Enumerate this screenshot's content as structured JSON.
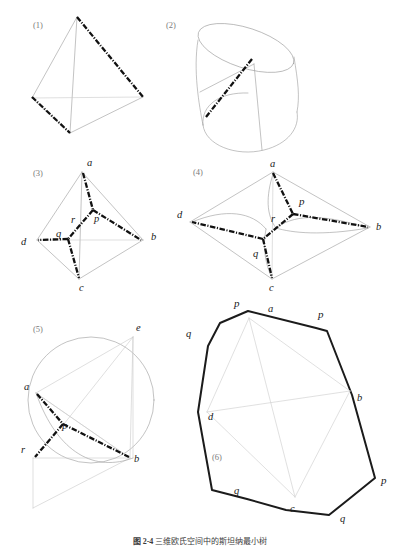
{
  "figure": {
    "background_color": "#ffffff",
    "ink_color": "#111111",
    "thin_line_color": "#9a9a9a",
    "pale_line_color": "#d2d2d2",
    "panel_number_color": "#7a7a7a"
  },
  "panels": [
    {
      "id": "panel-1",
      "number": "(1)",
      "description": "tetrahedron wireframe with two bold dash-dot edges",
      "labels": []
    },
    {
      "id": "panel-2",
      "number": "(2)",
      "description": "tilted cylinder with a bold dash-dot generatrix line",
      "labels": []
    },
    {
      "id": "panel-3",
      "number": "(3)",
      "description": "tetrahedron with Steiner tree a-p-b, p-r-q, q-d, q-c",
      "labels": [
        "a",
        "b",
        "c",
        "d",
        "p",
        "q",
        "r"
      ]
    },
    {
      "id": "panel-4",
      "number": "(4)",
      "description": "unfolded tetrahedron rhombus with curved creases and Steiner tree",
      "labels": [
        "a",
        "b",
        "c",
        "d",
        "p",
        "q",
        "r"
      ]
    },
    {
      "id": "panel-5",
      "number": "(5)",
      "description": "circle with inscribed triangle a-b-e and Steiner point p, r",
      "labels": [
        "a",
        "b",
        "e",
        "p",
        "r"
      ]
    },
    {
      "id": "panel-6",
      "number": "(6)",
      "description": "heavy octagonal outline with inner quadrilateral a-b-c-d",
      "labels": [
        "a",
        "b",
        "c",
        "d",
        "p",
        "p",
        "p",
        "q",
        "q",
        "q"
      ]
    }
  ],
  "vertex_labels": {
    "panel3": [
      {
        "text": "a",
        "x": 87,
        "y": 166
      },
      {
        "text": "b",
        "x": 151,
        "y": 240
      },
      {
        "text": "c",
        "x": 79,
        "y": 286
      },
      {
        "text": "d",
        "x": 25,
        "y": 242
      },
      {
        "text": "p",
        "x": 94,
        "y": 218
      },
      {
        "text": "q",
        "x": 58,
        "y": 237
      },
      {
        "text": "r",
        "x": 72,
        "y": 222
      }
    ],
    "panel4": [
      {
        "text": "a",
        "x": 275,
        "y": 166
      },
      {
        "text": "b",
        "x": 378,
        "y": 227
      },
      {
        "text": "c",
        "x": 272,
        "y": 286
      },
      {
        "text": "d",
        "x": 180,
        "y": 218
      },
      {
        "text": "p",
        "x": 298,
        "y": 202
      },
      {
        "text": "q",
        "x": 254,
        "y": 252
      },
      {
        "text": "r",
        "x": 272,
        "y": 220
      }
    ],
    "panel5": [
      {
        "text": "a",
        "x": 25,
        "y": 390
      },
      {
        "text": "b",
        "x": 134,
        "y": 457
      },
      {
        "text": "e",
        "x": 143,
        "y": 331
      },
      {
        "text": "p",
        "x": 59,
        "y": 430
      },
      {
        "text": "r",
        "x": 24,
        "y": 445
      }
    ],
    "panel6": [
      {
        "text": "p",
        "x": 237,
        "y": 305
      },
      {
        "text": "a",
        "x": 271,
        "y": 310
      },
      {
        "text": "p",
        "x": 321,
        "y": 315
      },
      {
        "text": "q",
        "x": 189,
        "y": 334
      },
      {
        "text": "b",
        "x": 357,
        "y": 398
      },
      {
        "text": "d",
        "x": 213,
        "y": 417
      },
      {
        "text": "p",
        "x": 381,
        "y": 480
      },
      {
        "text": "q",
        "x": 238,
        "y": 491
      },
      {
        "text": "c",
        "x": 293,
        "y": 503
      },
      {
        "text": "q",
        "x": 342,
        "y": 511
      }
    ]
  },
  "panel_numbers": [
    {
      "text": "(1)",
      "x": 33,
      "y": 28
    },
    {
      "text": "(2)",
      "x": 166,
      "y": 28
    },
    {
      "text": "(3)",
      "x": 33,
      "y": 176
    },
    {
      "text": "(4)",
      "x": 193,
      "y": 175
    },
    {
      "text": "(5)",
      "x": 33,
      "y": 332
    },
    {
      "text": "(6)",
      "x": 212,
      "y": 460
    }
  ],
  "caption": {
    "figure_number": "图 2-4",
    "text": "三维欧氏空间中的斯坦纳最小树",
    "full": "图 2-4　三维欧氏空间中的斯坦纳最小树"
  }
}
